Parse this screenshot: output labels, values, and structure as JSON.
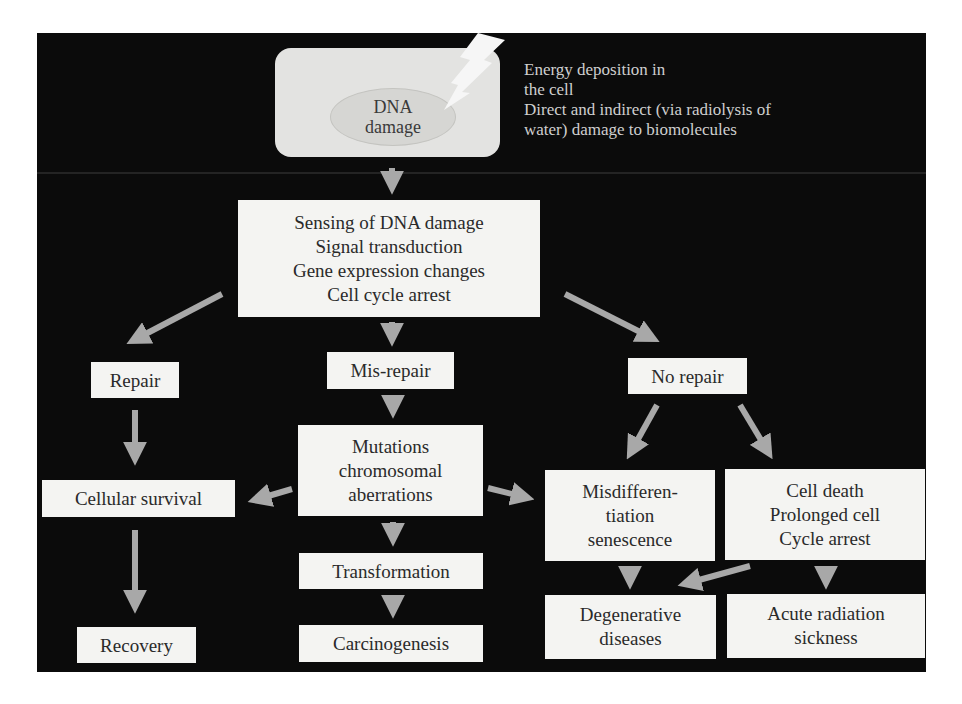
{
  "diagram": {
    "colors": {
      "panel_background": "#0b0b0b",
      "box_fill": "#f4f4f2",
      "box_text": "#2a2a2a",
      "arrow": "#a8a8a8",
      "annotation_text": "#cfcfcf",
      "cell_fill": "#e3e3e1",
      "nucleus_fill": "#d6d6d3"
    },
    "top": {
      "cell_label": "DNA\ndamage",
      "energy_lines": [
        "Energy deposition in",
        "the cell",
        "Direct and indirect (via radiolysis of",
        "water) damage to biomolecules"
      ]
    },
    "nodes": {
      "sensing": "Sensing of DNA damage\nSignal transduction\nGene expression changes\nCell cycle arrest",
      "repair": "Repair",
      "misrepair": "Mis-repair",
      "norepair": "No repair",
      "survival": "Cellular survival",
      "recovery": "Recovery",
      "mutations": "Mutations\nchromosomal\naberrations",
      "transformation": "Transformation",
      "carcinogenesis": "Carcinogenesis",
      "misdifferentiation": "Misdifferen-\ntiation\nsenescence",
      "celldeath": "Cell death\nProlonged cell\nCycle arrest",
      "degenerative": "Degenerative\ndiseases",
      "acute": "Acute radiation\nsickness"
    },
    "edges": [
      {
        "from": "dna-damage",
        "to": "sensing"
      },
      {
        "from": "sensing",
        "to": "repair"
      },
      {
        "from": "sensing",
        "to": "misrepair"
      },
      {
        "from": "sensing",
        "to": "norepair"
      },
      {
        "from": "repair",
        "to": "survival"
      },
      {
        "from": "survival",
        "to": "recovery"
      },
      {
        "from": "misrepair",
        "to": "mutations"
      },
      {
        "from": "mutations",
        "to": "survival"
      },
      {
        "from": "mutations",
        "to": "misdifferentiation"
      },
      {
        "from": "mutations",
        "to": "transformation"
      },
      {
        "from": "transformation",
        "to": "carcinogenesis"
      },
      {
        "from": "norepair",
        "to": "misdifferentiation"
      },
      {
        "from": "norepair",
        "to": "celldeath"
      },
      {
        "from": "misdifferentiation",
        "to": "degenerative"
      },
      {
        "from": "celldeath",
        "to": "degenerative"
      },
      {
        "from": "celldeath",
        "to": "acute"
      }
    ]
  }
}
